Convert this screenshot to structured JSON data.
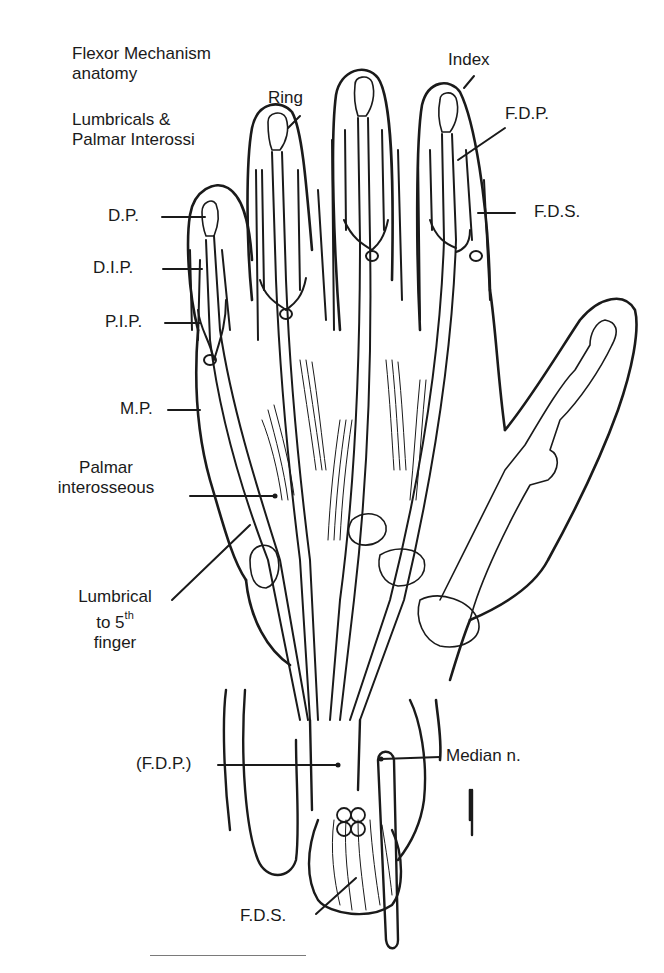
{
  "figure": {
    "title_line1": "Flexor Mechanism",
    "title_line2": "anatomy",
    "subtitle_line1": "Lumbricals &",
    "subtitle_line2": "Palmar Interossi"
  },
  "labels": {
    "ring": "Ring",
    "index": "Index",
    "fdp_top": "F.D.P.",
    "fds_top": "F.D.S.",
    "dp": "D.P.",
    "dip": "D.I.P.",
    "pip": "P.I.P.",
    "mp": "M.P.",
    "palmar_line1": "Palmar",
    "palmar_line2": "interosseous",
    "lumbrical_line1": "Lumbrical",
    "lumbrical_line2_prefix": "to 5",
    "lumbrical_line2_sup": "th",
    "lumbrical_line3": "finger",
    "fdp_bottom": "(F.D.P.)",
    "median": "Median  n.",
    "fds_bottom": "F.D.S."
  },
  "colors": {
    "ink": "#1a1a1a",
    "background": "#ffffff",
    "rule": "#7a7a7a"
  }
}
